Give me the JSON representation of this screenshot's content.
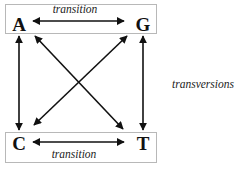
{
  "diagram": {
    "nodes": [
      {
        "id": "A",
        "label": "A",
        "x": 19,
        "y": 24
      },
      {
        "id": "G",
        "label": "G",
        "x": 143,
        "y": 24
      },
      {
        "id": "C",
        "label": "C",
        "x": 19,
        "y": 143
      },
      {
        "id": "T",
        "label": "T",
        "x": 143,
        "y": 143
      }
    ],
    "edges": [
      {
        "from": "A",
        "to": "G",
        "type": "transition",
        "bidirectional": true
      },
      {
        "from": "C",
        "to": "T",
        "type": "transition",
        "bidirectional": true
      },
      {
        "from": "A",
        "to": "C",
        "type": "transversion",
        "bidirectional": true
      },
      {
        "from": "G",
        "to": "T",
        "type": "transversion",
        "bidirectional": true
      },
      {
        "from": "A",
        "to": "T",
        "type": "transversion",
        "bidirectional": true
      },
      {
        "from": "G",
        "to": "C",
        "type": "transversion",
        "bidirectional": true
      }
    ],
    "labels": {
      "top_transition": "transition",
      "bottom_transition": "transition",
      "transversions": "transversions"
    },
    "colors": {
      "arrow": "#111111",
      "box_border": "#b8b8b8",
      "text": "#111111"
    }
  }
}
